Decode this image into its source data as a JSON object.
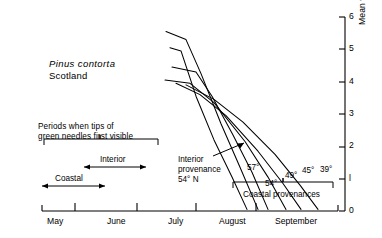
{
  "figure": {
    "species": "Pinus contorta",
    "location": "Scotland"
  },
  "annotations": {
    "periods_line1": "Periods when tips of",
    "periods_line2": "green needles first visible",
    "interior_label": "Interior",
    "coastal_label": "Coastal",
    "interior_prov_line1": "Interior",
    "interior_prov_line2": "provenance",
    "interior_prov_line3": "54° N",
    "coastal_provenances": "Coastal provenances"
  },
  "chart_data": {
    "type": "line",
    "title": "Pinus contorta  Scotland",
    "xlabel": "",
    "ylabel": "Mean weekly increase in needle length ( mm )",
    "ylim": [
      0,
      6
    ],
    "yticks": [
      0,
      1,
      2,
      3,
      4,
      5,
      6
    ],
    "ytick_labels": [
      "0",
      "l",
      "2",
      "3",
      "4",
      "5",
      "6"
    ],
    "xticks": [
      "May",
      "June",
      "July",
      "August",
      "September"
    ],
    "grid": false,
    "legend": "none",
    "x_axis_note": "Months May through September; curves begin in July",
    "series": [
      {
        "name": "Interior provenance 54° N",
        "label": "54° N interior",
        "latitude": 54,
        "type": "interior",
        "points": [
          {
            "x": 170,
            "y": 5.05
          },
          {
            "x": 181,
            "y": 4.95
          },
          {
            "x": 196,
            "y": 3.55
          },
          {
            "x": 214,
            "y": 2.2
          },
          {
            "x": 232,
            "y": 1.05
          },
          {
            "x": 247,
            "y": 0.05
          }
        ]
      },
      {
        "name": "57°",
        "label": "57°",
        "latitude": 57,
        "type": "coastal",
        "points": [
          {
            "x": 166,
            "y": 5.55
          },
          {
            "x": 186,
            "y": 5.3
          },
          {
            "x": 201,
            "y": 4.25
          },
          {
            "x": 221,
            "y": 2.7
          },
          {
            "x": 240,
            "y": 1.35
          },
          {
            "x": 258,
            "y": 0.05
          }
        ]
      },
      {
        "name": "54°",
        "label": "54°",
        "latitude": 54,
        "type": "coastal",
        "points": [
          {
            "x": 172,
            "y": 4.45
          },
          {
            "x": 196,
            "y": 4.3
          },
          {
            "x": 212,
            "y": 3.55
          },
          {
            "x": 233,
            "y": 2.35
          },
          {
            "x": 252,
            "y": 1.2
          },
          {
            "x": 268,
            "y": 0.05
          }
        ]
      },
      {
        "name": "49°",
        "label": "49°",
        "latitude": 49,
        "type": "coastal",
        "points": [
          {
            "x": 165,
            "y": 4.05
          },
          {
            "x": 190,
            "y": 3.95
          },
          {
            "x": 214,
            "y": 3.35
          },
          {
            "x": 245,
            "y": 2.15
          },
          {
            "x": 268,
            "y": 1.05
          },
          {
            "x": 286,
            "y": 0.05
          }
        ]
      },
      {
        "name": "45°",
        "label": "45°",
        "latitude": 45,
        "type": "coastal",
        "points": [
          {
            "x": 176,
            "y": 3.95
          },
          {
            "x": 200,
            "y": 3.6
          },
          {
            "x": 226,
            "y": 2.95
          },
          {
            "x": 258,
            "y": 1.85
          },
          {
            "x": 283,
            "y": 0.85
          },
          {
            "x": 301,
            "y": 0.05
          }
        ]
      },
      {
        "name": "39°",
        "label": "39°",
        "latitude": 39,
        "type": "coastal",
        "points": [
          {
            "x": 186,
            "y": 3.9
          },
          {
            "x": 214,
            "y": 3.45
          },
          {
            "x": 243,
            "y": 2.75
          },
          {
            "x": 275,
            "y": 1.75
          },
          {
            "x": 300,
            "y": 0.8
          },
          {
            "x": 318,
            "y": 0.05
          }
        ]
      }
    ],
    "latitude_labels": [
      {
        "text": "57°",
        "x": 247,
        "y": 163
      },
      {
        "text": "54°",
        "x": 265,
        "y": 179
      },
      {
        "text": "49°",
        "x": 285,
        "y": 171
      },
      {
        "text": "45°",
        "x": 302,
        "y": 166
      },
      {
        "text": "39°",
        "x": 320,
        "y": 165
      }
    ],
    "month_labels": [
      {
        "text": "May",
        "x": 47
      },
      {
        "text": "June",
        "x": 107
      },
      {
        "text": "July",
        "x": 168
      },
      {
        "text": "August",
        "x": 219
      },
      {
        "text": "September",
        "x": 275
      }
    ]
  }
}
